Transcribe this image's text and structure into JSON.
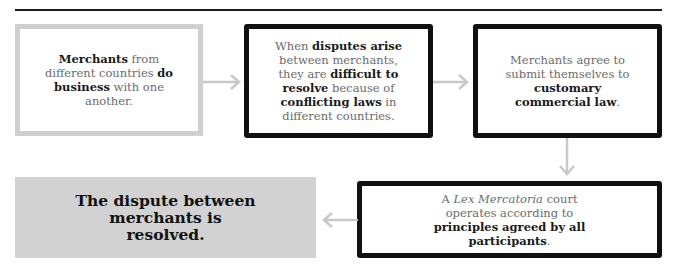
{
  "steps": [
    {
      "id": "1",
      "parts": [
        {
          "t": "Merchants",
          "b": true
        },
        {
          "t": " from different countries "
        },
        {
          "t": "do business",
          "b": true
        },
        {
          "t": " with one another."
        }
      ]
    },
    {
      "id": "2",
      "parts": [
        {
          "t": "When "
        },
        {
          "t": "disputes arise",
          "b": true
        },
        {
          "t": " between merchants, they are "
        },
        {
          "t": "difficult to resolve",
          "b": true
        },
        {
          "t": " because of "
        },
        {
          "t": "conflicting laws",
          "b": true
        },
        {
          "t": " in different countries."
        }
      ]
    },
    {
      "id": "3",
      "parts": [
        {
          "t": "Merchants agree to submit themselves to "
        },
        {
          "t": "customary commercial law",
          "b": true
        },
        {
          "t": "."
        }
      ]
    },
    {
      "id": "4",
      "parts": [
        {
          "t": "A "
        },
        {
          "t": "Lex Mercatoria",
          "i": true
        },
        {
          "t": " court operates according to "
        },
        {
          "t": "principles agreed by all participants",
          "b": true
        },
        {
          "t": "."
        }
      ]
    },
    {
      "id": "5",
      "text": "The dispute between merchants is resolved."
    }
  ],
  "colors": {
    "arrow": "#c8c8c8",
    "border_light": "#cfcfcf",
    "border_dark": "#111111",
    "fill": "#d2d2d2"
  }
}
